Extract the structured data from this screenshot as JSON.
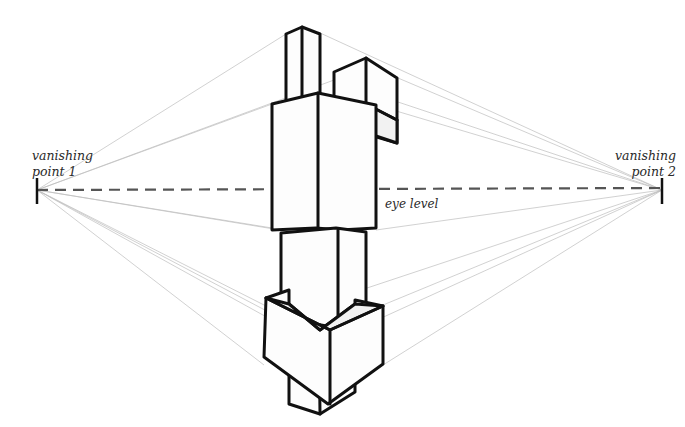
{
  "diagram": {
    "type": "two-point perspective drawing",
    "labels": {
      "vanishing_point_1": [
        "vanishing",
        "point 1"
      ],
      "vanishing_point_2": [
        "vanishing",
        "point 2"
      ],
      "eye_level": "eye level"
    },
    "vanishing_points": [
      {
        "name": "vanishing point 1",
        "x": 37,
        "y": 190
      },
      {
        "name": "vanishing point 2",
        "x": 662,
        "y": 190
      }
    ],
    "horizon": {
      "label": "eye level",
      "y": 190,
      "style": "dashed"
    },
    "objects": [
      "tall rectangular column (top)",
      "small box (top right)",
      "large box (upper)",
      "box at eye level",
      "narrow column (lower)",
      "bottom box"
    ],
    "colors": {
      "background": "#ffffff",
      "ink": "#111111",
      "guide_lines": "#bdbdbd",
      "eye_level_line": "#555555"
    }
  }
}
